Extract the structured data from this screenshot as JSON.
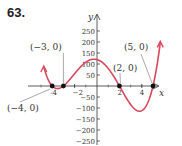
{
  "problem_number": "63.",
  "axes": {
    "x_label": "x",
    "y_label": "y",
    "x_ticks": [
      {
        "value": -4,
        "label": "-4"
      },
      {
        "value": -2,
        "label": "−2"
      },
      {
        "value": 2,
        "label": "2"
      },
      {
        "value": 4,
        "label": "4"
      }
    ],
    "y_ticks": [
      {
        "value": 250,
        "label": "250"
      },
      {
        "value": 200,
        "label": "200"
      },
      {
        "value": 150,
        "label": "150"
      },
      {
        "value": 100,
        "label": "100"
      },
      {
        "value": 50,
        "label": "50"
      },
      {
        "value": -50,
        "label": "−50"
      },
      {
        "value": -100,
        "label": "−100"
      },
      {
        "value": -150,
        "label": "−150"
      },
      {
        "value": -200,
        "label": "−200"
      },
      {
        "value": -250,
        "label": "−250"
      }
    ]
  },
  "points": [
    {
      "x": -4,
      "y": 0,
      "label": "(−4, 0)"
    },
    {
      "x": -3,
      "y": 0,
      "label": "(−3, 0)"
    },
    {
      "x": 2,
      "y": 0,
      "label": "(2, 0)"
    },
    {
      "x": 5,
      "y": 0,
      "label": "(5, 0)"
    }
  ],
  "colors": {
    "curve": "#d9475c",
    "axis": "#333333",
    "point": "#111111"
  },
  "chart_data": {
    "type": "line",
    "title": "63.",
    "xlabel": "x",
    "ylabel": "y",
    "function": "y = (x+4)(x+3)(x-2)(x-5)",
    "zeros": [
      -4,
      -3,
      2,
      5
    ],
    "x_ticks": [
      -4,
      -2,
      2,
      4
    ],
    "y_ticks": [
      -250,
      -200,
      -150,
      -100,
      -50,
      50,
      100,
      150,
      200,
      250
    ],
    "ylim": [
      -275,
      275
    ],
    "xlim": [
      -6,
      6
    ],
    "annotated_points": [
      [
        -4,
        0
      ],
      [
        -3,
        0
      ],
      [
        2,
        0
      ],
      [
        5,
        0
      ]
    ],
    "grid": false
  }
}
